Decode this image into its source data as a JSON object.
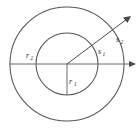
{
  "figure": {
    "type": "geometry-diagram",
    "canvas": {
      "width": 139,
      "height": 132,
      "background": "#ffffff"
    },
    "center": {
      "x": 67,
      "y": 64
    },
    "circles": [
      {
        "name": "inner-circle",
        "radius": 31,
        "stroke": "#555555"
      },
      {
        "name": "outer-circle",
        "radius": 57,
        "stroke": "#555555"
      }
    ],
    "rays": [
      {
        "name": "horizontal-axis",
        "angle_deg": 0,
        "from": {
          "x": 10,
          "y": 64
        },
        "to": {
          "x": 136,
          "y": 64
        },
        "arrow": "right"
      },
      {
        "name": "diagonal-ray",
        "angle_deg": 42,
        "from": {
          "x": 67,
          "y": 64
        },
        "to": {
          "x": 130,
          "y": 16
        },
        "arrow": "end"
      },
      {
        "name": "vertical-radius",
        "angle_deg": -90,
        "from": {
          "x": 67,
          "y": 64
        },
        "to": {
          "x": 67,
          "y": 95
        },
        "arrow": "none"
      }
    ],
    "labels": {
      "r1": {
        "text": "r",
        "sub": "1",
        "x": 70,
        "y": 82,
        "describes": "inner radius drawn downward from center"
      },
      "r2": {
        "text": "r",
        "sub": "2",
        "x": 27,
        "y": 57,
        "describes": "outer radius marker on left"
      },
      "s1": {
        "text": "s",
        "sub": "1",
        "x": 99,
        "y": 52,
        "describes": "arc length on inner circle"
      },
      "s2": {
        "text": "s",
        "sub": "2",
        "x": 117,
        "y": 41,
        "describes": "arc length on outer circle"
      }
    },
    "colors": {
      "curve": "#555555",
      "line": "#6a6a6a",
      "ray": "#4a4a4a",
      "label": "#2b2b2b",
      "background": "#ffffff"
    }
  }
}
